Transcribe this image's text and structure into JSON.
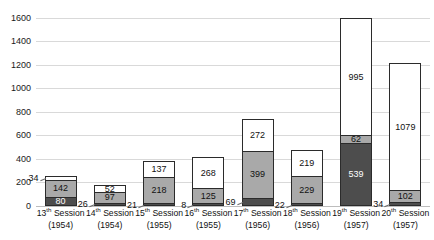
{
  "chart_data": {
    "type": "bar",
    "title": "",
    "subtitle": "",
    "xlabel": "",
    "ylabel": "",
    "stacked": true,
    "grid": true,
    "legend": "none",
    "ylim": [
      0,
      1700
    ],
    "yticks": [
      0,
      200,
      400,
      600,
      800,
      1000,
      1200,
      1400,
      1600
    ],
    "ytick_labels": [
      "0",
      "200",
      "400",
      "600",
      "800",
      "1000",
      "1200",
      "1400",
      "1600"
    ],
    "categories": [
      "13th Session (1954)",
      "14th Session (1954)",
      "15th Session (1955)",
      "16th Session (1955)",
      "17th Session (1956)",
      "18th Session (1956)",
      "19th Session (1957)",
      "20th Session (1957)"
    ],
    "category_parts": [
      {
        "ordinal": "13",
        "suffix": "th",
        "word": "Session",
        "year": "(1954)"
      },
      {
        "ordinal": "14",
        "suffix": "th",
        "word": "Session",
        "year": "(1954)"
      },
      {
        "ordinal": "15",
        "suffix": "th",
        "word": "Session",
        "year": "(1955)"
      },
      {
        "ordinal": "16",
        "suffix": "th",
        "word": "Session",
        "year": "(1955)"
      },
      {
        "ordinal": "17",
        "suffix": "th",
        "word": "Session",
        "year": "(1956)"
      },
      {
        "ordinal": "18",
        "suffix": "th",
        "word": "Session",
        "year": "(1956)"
      },
      {
        "ordinal": "19",
        "suffix": "th",
        "word": "Session",
        "year": "(1957)"
      },
      {
        "ordinal": "20",
        "suffix": "th",
        "word": "Session",
        "year": "(1957)"
      }
    ],
    "series": [
      {
        "name": "bottom",
        "color": "#4d4d4d",
        "values": [
          80,
          26,
          21,
          8,
          69,
          22,
          539,
          34
        ]
      },
      {
        "name": "middle",
        "color": "#a9a9a9",
        "values": [
          142,
          97,
          218,
          125,
          399,
          229,
          62,
          102
        ]
      },
      {
        "name": "top",
        "color": "#ffffff",
        "values": [
          34,
          52,
          137,
          268,
          272,
          219,
          995,
          1079
        ]
      }
    ],
    "totals": [
      256,
      175,
      376,
      401,
      740,
      470,
      1596,
      1215
    ],
    "bars": [
      {
        "category": "13th Session (1954)",
        "segments": [
          {
            "series": "top",
            "value": 34,
            "label": "34",
            "label_position": "outside"
          },
          {
            "series": "middle",
            "value": 142,
            "label": "142",
            "label_position": "inside"
          },
          {
            "series": "bottom",
            "value": 80,
            "label": "80",
            "label_position": "inside"
          }
        ]
      },
      {
        "category": "14th Session (1954)",
        "segments": [
          {
            "series": "top",
            "value": 52,
            "label": "52",
            "label_position": "inside"
          },
          {
            "series": "middle",
            "value": 97,
            "label": "97",
            "label_position": "inside"
          },
          {
            "series": "bottom",
            "value": 26,
            "label": "26",
            "label_position": "outside"
          }
        ]
      },
      {
        "category": "15th Session (1955)",
        "segments": [
          {
            "series": "top",
            "value": 137,
            "label": "137",
            "label_position": "inside"
          },
          {
            "series": "middle",
            "value": 218,
            "label": "218",
            "label_position": "inside"
          },
          {
            "series": "bottom",
            "value": 21,
            "label": "21",
            "label_position": "outside"
          }
        ]
      },
      {
        "category": "16th Session (1955)",
        "segments": [
          {
            "series": "top",
            "value": 268,
            "label": "268",
            "label_position": "inside"
          },
          {
            "series": "middle",
            "value": 125,
            "label": "125",
            "label_position": "inside"
          },
          {
            "series": "bottom",
            "value": 8,
            "label": "8",
            "label_position": "outside"
          }
        ]
      },
      {
        "category": "17th Session (1956)",
        "segments": [
          {
            "series": "top",
            "value": 272,
            "label": "272",
            "label_position": "inside"
          },
          {
            "series": "middle",
            "value": 399,
            "label": "399",
            "label_position": "inside"
          },
          {
            "series": "bottom",
            "value": 69,
            "label": "69",
            "label_position": "outside"
          }
        ]
      },
      {
        "category": "18th Session (1956)",
        "segments": [
          {
            "series": "top",
            "value": 219,
            "label": "219",
            "label_position": "inside"
          },
          {
            "series": "middle",
            "value": 229,
            "label": "229",
            "label_position": "inside"
          },
          {
            "series": "bottom",
            "value": 22,
            "label": "22",
            "label_position": "outside"
          }
        ]
      },
      {
        "category": "19th Session (1957)",
        "segments": [
          {
            "series": "top",
            "value": 995,
            "label": "995",
            "label_position": "inside"
          },
          {
            "series": "middle",
            "value": 62,
            "label": "62",
            "label_position": "inside"
          },
          {
            "series": "bottom",
            "value": 539,
            "label": "539",
            "label_position": "inside"
          }
        ]
      },
      {
        "category": "20th Session (1957)",
        "segments": [
          {
            "series": "top",
            "value": 1079,
            "label": "1079",
            "label_position": "inside"
          },
          {
            "series": "middle",
            "value": 102,
            "label": "102",
            "label_position": "inside"
          },
          {
            "series": "bottom",
            "value": 34,
            "label": "34",
            "label_position": "outside"
          }
        ]
      }
    ]
  },
  "colors": {
    "bottom_segment": "#4d4d4d",
    "middle_segment": "#a9a9a9",
    "top_segment": "#ffffff",
    "segment_border": "#2b2b2b",
    "gridline": "#d9d9d9",
    "axis_text": "#111111",
    "background": "#ffffff"
  }
}
